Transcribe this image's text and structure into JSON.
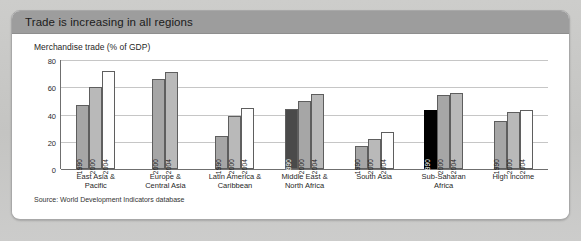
{
  "card": {
    "header_title": "Trade is increasing in all regions",
    "chart_title": "Merchandise trade (% of GDP)",
    "source": "Source: World Development Indicators database"
  },
  "colors": {
    "header_bg": "#9d9d9d",
    "card_bg": "#ffffff",
    "page_bg": "#c8c8c6",
    "bar_1990": "#a6a6a6",
    "bar_1990_dark": "#4a4a4a",
    "bar_1990_black": "#000000",
    "bar_2000": "#b9b9b9",
    "bar_2004": "#fdfdfd",
    "gridline": "#c6c6c6",
    "axis": "#6f6f6f"
  },
  "chart_data": {
    "type": "bar",
    "title": "Merchandise trade (% of GDP)",
    "xlabel": "",
    "ylabel": "",
    "ylim": [
      0,
      80
    ],
    "yticks": [
      0,
      20,
      40,
      60,
      80
    ],
    "grid": true,
    "legend_position": "none",
    "series_names": [
      "1990",
      "2000",
      "2004"
    ],
    "categories": [
      "East Asia & Pacific",
      "Europe & Central Asia",
      "Latin America & Caribbean",
      "Middle East & North Africa",
      "South Asia",
      "Sub-Saharan Africa",
      "High income"
    ],
    "series": [
      {
        "name": "1990",
        "values": [
          47,
          null,
          24,
          44,
          17,
          43,
          35
        ]
      },
      {
        "name": "2000",
        "values": [
          60,
          66,
          39,
          50,
          22,
          54,
          42
        ]
      },
      {
        "name": "2004",
        "values": [
          72,
          71,
          45,
          55,
          27,
          56,
          43
        ]
      }
    ],
    "groups": [
      {
        "label_line1": "East Asia &",
        "label_line2": "Pacific",
        "bars": [
          {
            "year": "1990",
            "value": 47,
            "style": "mid"
          },
          {
            "year": "2000",
            "value": 60,
            "style": "light"
          },
          {
            "year": "2004",
            "value": 72,
            "style": "white"
          }
        ]
      },
      {
        "label_line1": "Europe &",
        "label_line2": "Central Asia",
        "bars": [
          {
            "year": "2000",
            "value": 66,
            "style": "mid"
          },
          {
            "year": "2004",
            "value": 71,
            "style": "light"
          }
        ]
      },
      {
        "label_line1": "Latin America &",
        "label_line2": "Caribbean",
        "bars": [
          {
            "year": "1990",
            "value": 24,
            "style": "mid"
          },
          {
            "year": "2000",
            "value": 39,
            "style": "light"
          },
          {
            "year": "2004",
            "value": 45,
            "style": "white"
          }
        ]
      },
      {
        "label_line1": "Middle East &",
        "label_line2": "North Africa",
        "bars": [
          {
            "year": "1990",
            "value": 44,
            "style": "dark"
          },
          {
            "year": "2000",
            "value": 50,
            "style": "mid"
          },
          {
            "year": "2004",
            "value": 55,
            "style": "light"
          }
        ]
      },
      {
        "label_line1": "South Asia",
        "label_line2": "",
        "bars": [
          {
            "year": "1990",
            "value": 17,
            "style": "mid"
          },
          {
            "year": "2000",
            "value": 22,
            "style": "light"
          },
          {
            "year": "2004",
            "value": 27,
            "style": "white"
          }
        ]
      },
      {
        "label_line1": "Sub-Saharan",
        "label_line2": "Africa",
        "bars": [
          {
            "year": "1990",
            "value": 43,
            "style": "black"
          },
          {
            "year": "2000",
            "value": 54,
            "style": "mid"
          },
          {
            "year": "2004",
            "value": 56,
            "style": "light"
          }
        ]
      },
      {
        "label_line1": "High income",
        "label_line2": "",
        "bars": [
          {
            "year": "1990",
            "value": 35,
            "style": "mid"
          },
          {
            "year": "2000",
            "value": 42,
            "style": "light"
          },
          {
            "year": "2004",
            "value": 43,
            "style": "white"
          }
        ]
      }
    ]
  }
}
